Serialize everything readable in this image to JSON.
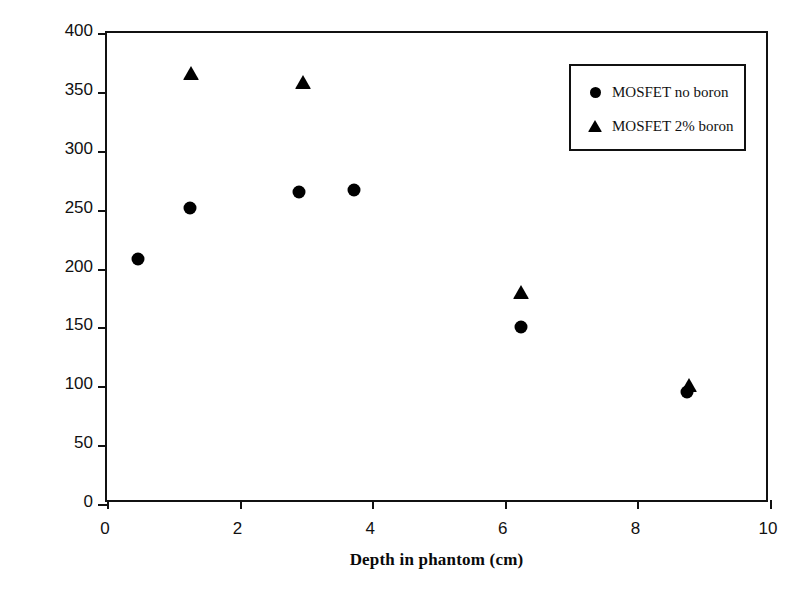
{
  "chart_data": {
    "type": "scatter",
    "title": "",
    "xlabel": "Depth in phantom (cm)",
    "ylabel": "Threshold voltage change (mV)",
    "xlim": [
      0,
      10
    ],
    "ylim": [
      0,
      400
    ],
    "xticks": [
      0,
      2,
      4,
      6,
      8,
      10
    ],
    "yticks": [
      0,
      50,
      100,
      150,
      200,
      250,
      300,
      350,
      400
    ],
    "xtick_labels": [
      "0",
      "2",
      "4",
      "6",
      "8",
      "10"
    ],
    "ytick_labels": [
      "0",
      "50",
      "100",
      "150",
      "200",
      "250",
      "300",
      "350",
      "400"
    ],
    "grid": false,
    "legend_position": "upper right",
    "series": [
      {
        "name": "MOSFET no boron",
        "marker": "circle",
        "color": "#000000",
        "points": [
          {
            "x": 0.47,
            "y": 208
          },
          {
            "x": 1.25,
            "y": 251
          },
          {
            "x": 2.9,
            "y": 265
          },
          {
            "x": 3.72,
            "y": 267
          },
          {
            "x": 6.25,
            "y": 150
          },
          {
            "x": 8.75,
            "y": 95
          }
        ]
      },
      {
        "name": "MOSFET 2% boron",
        "marker": "triangle",
        "color": "#000000",
        "points": [
          {
            "x": 1.27,
            "y": 366
          },
          {
            "x": 2.95,
            "y": 358
          },
          {
            "x": 6.25,
            "y": 180
          },
          {
            "x": 8.78,
            "y": 101
          }
        ]
      }
    ]
  },
  "legend": {
    "items": [
      {
        "label": "MOSFET no boron",
        "marker": "circle"
      },
      {
        "label": "MOSFET 2% boron",
        "marker": "triangle"
      }
    ]
  }
}
